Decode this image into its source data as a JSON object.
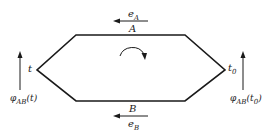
{
  "diagram": {
    "top_arrow_label": "e",
    "top_arrow_sub": "A",
    "top_edge_label": "A",
    "bottom_edge_label": "B",
    "bottom_arrow_label": "e",
    "bottom_arrow_sub": "B",
    "left_vertex_label": "t",
    "right_vertex_label": "t",
    "right_vertex_sub": "0",
    "left_phase_label": "φ",
    "left_phase_sub": "AB",
    "left_phase_arg": "(t)",
    "right_phase_label": "φ",
    "right_phase_sub": "AB",
    "right_phase_arg_pre": "(t",
    "right_phase_arg_sub": "0",
    "right_phase_arg_post": ")",
    "stroke_color": "#1a1a1a"
  }
}
